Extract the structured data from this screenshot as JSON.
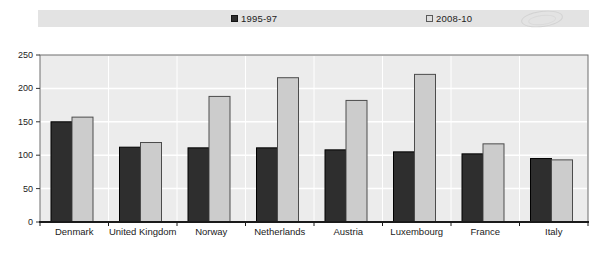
{
  "legend": {
    "series1_label": "1995-97",
    "series2_label": "2008-10"
  },
  "colors": {
    "series1_fill": "#2e2e2e",
    "series1_stroke": "#000000",
    "series2_fill": "#cccccc",
    "series2_stroke": "#4c4c4c",
    "plot_background": "#ececec",
    "plot_border": "#6e6e6e",
    "gridline": "#ffffff",
    "axis_line": "#1a1a1a",
    "tick_color": "#333333",
    "label_color": "#222222",
    "legend_strip_background": "#e3e3e3"
  },
  "chart_data": {
    "type": "bar",
    "categories": [
      "Denmark",
      "United Kingdom",
      "Norway",
      "Netherlands",
      "Austria",
      "Luxembourg",
      "France",
      "Italy"
    ],
    "series": [
      {
        "name": "1995-97",
        "values": [
          150,
          112,
          111,
          111,
          108,
          105,
          102,
          95
        ]
      },
      {
        "name": "2008-10",
        "values": [
          157,
          119,
          188,
          216,
          182,
          221,
          117,
          93
        ]
      }
    ],
    "title": "",
    "xlabel": "",
    "ylabel": "",
    "ylim": [
      0,
      250
    ],
    "yticks": [
      0,
      50,
      100,
      150,
      200,
      250
    ],
    "grid": true,
    "legend_position": "top"
  }
}
